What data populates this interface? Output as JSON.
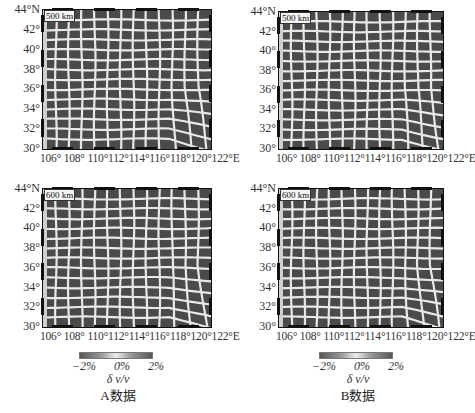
{
  "figure": {
    "type": "checkerboard resolution test maps",
    "panels": [
      {
        "id": "A-500",
        "depth_label": "500 km",
        "dataset": "A"
      },
      {
        "id": "B-500",
        "depth_label": "500 km",
        "dataset": "B"
      },
      {
        "id": "A-600",
        "depth_label": "600 km",
        "dataset": "A"
      },
      {
        "id": "B-600",
        "depth_label": "600 km",
        "dataset": "B"
      }
    ],
    "y_ticks": [
      "44°N",
      "42°",
      "40°",
      "38°",
      "36°",
      "34°",
      "32°",
      "30°"
    ],
    "x_ticks_label": "106° 108° 110°112°114°116°118°120°122°E",
    "x_ticks": [
      "106°",
      "108°",
      "110°",
      "112°",
      "114°",
      "116°",
      "118°",
      "120°",
      "122°E"
    ],
    "colorbars": [
      {
        "ticks": [
          "−2%",
          "0%",
          "2%"
        ],
        "variable": "δ v/v",
        "title": "A数据"
      },
      {
        "ticks": [
          "−2%",
          "0%",
          "2%"
        ],
        "variable": "δ v/v",
        "title": "B数据"
      }
    ],
    "colors": {
      "anomaly_low": "#444444",
      "anomaly_high": "#eeeeee",
      "background": "#ffffff"
    }
  },
  "chart_data": {
    "type": "heatmap",
    "xlabel": "Longitude",
    "ylabel": "Latitude",
    "xlim": [
      106,
      122
    ],
    "ylim": [
      30,
      44
    ],
    "x_tick_labels": [
      "106°",
      "108°",
      "110°",
      "112°",
      "114°",
      "116°",
      "118°",
      "120°",
      "122°E"
    ],
    "y_tick_labels": [
      "30°",
      "32°",
      "34°",
      "36°",
      "38°",
      "40°",
      "42°",
      "44°N"
    ],
    "colorbar": {
      "range": [
        -2,
        2
      ],
      "unit": "%",
      "ticks": [
        "−2%",
        "0%",
        "2%"
      ],
      "label": "δ v/v"
    },
    "panels": [
      {
        "dataset": "A数据",
        "depth": "500 km"
      },
      {
        "dataset": "B数据",
        "depth": "500 km"
      },
      {
        "dataset": "A数据",
        "depth": "600 km"
      },
      {
        "dataset": "B数据",
        "depth": "600 km"
      }
    ]
  }
}
